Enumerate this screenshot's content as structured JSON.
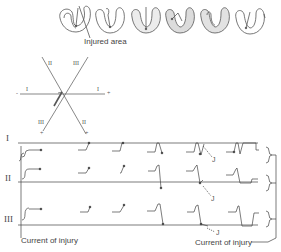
{
  "hearts": {
    "count": 6,
    "injured_area_label": "Injured area",
    "injured_fill": "#e6e6e6",
    "stroke": "#555555"
  },
  "axis_diagram": {
    "lead_labels": [
      "I",
      "II",
      "III"
    ],
    "axis_I_left": "I",
    "axis_I_right": "I",
    "axis_II_top": "II",
    "axis_III_top": "III",
    "axis_III_bottom": "III",
    "axis_II_bottom": "II",
    "minus": "-",
    "plus": "+"
  },
  "ecg": {
    "leads": [
      "I",
      "II",
      "III"
    ],
    "j_label": "J",
    "current_of_injury_left": "Current of injury",
    "current_of_injury_right": "Current of injury",
    "line_color": "#444444"
  }
}
